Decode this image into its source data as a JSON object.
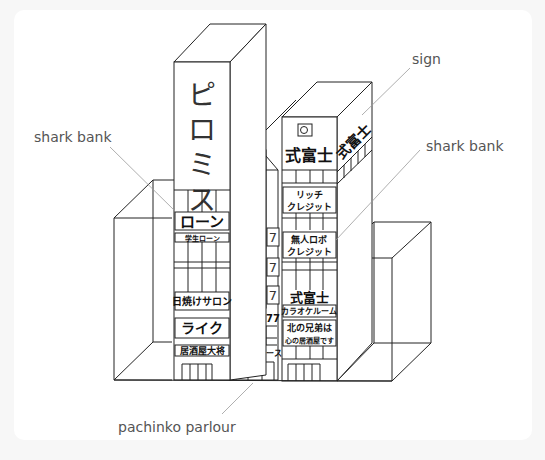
{
  "diagram": {
    "title": "",
    "callouts": {
      "shark_bank_left": "shark bank",
      "sign": "sign",
      "shark_bank_right": "shark bank",
      "pachinko_parlour": "pachinko parlour"
    },
    "left_tower": {
      "vertical_sign": [
        "ピ",
        "ロ",
        "ミ",
        "ス"
      ],
      "signs": {
        "loan": "ローン",
        "student_loan": "学生ローン",
        "tanning_salon": "日焼けサロン",
        "like": "ライク",
        "izakaya": "居酒屋大将"
      }
    },
    "middle_tower": {
      "vertical_sign": [
        "パ",
        "チ",
        "ス",
        "ロ",
        "タ",
        "ワ",
        "ー"
      ],
      "side_marks": "7",
      "sevens": "777・777",
      "pachislo_peace": "パチスロピース"
    },
    "right_tower": {
      "rooftop_sign_front": "式富士",
      "rooftop_sign_side": "式富士",
      "signs": {
        "rich_credit_1": "リッチ",
        "rich_credit_2": "クレジット",
        "unmanned_credit_1": "無人ロボ",
        "unmanned_credit_2": "クレジット",
        "shikifuji": "式富士",
        "karaoke": "カラオケルーム",
        "kita_1": "北の兄弟は",
        "kita_2": "心の居酒屋です"
      }
    }
  }
}
